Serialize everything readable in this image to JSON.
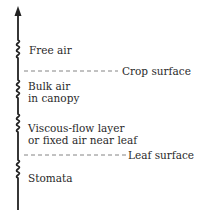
{
  "diagram": {
    "arrow_direction": "up",
    "layers": [
      {
        "label_lines": [
          "Free air"
        ]
      },
      {
        "label_lines": [
          "Bulk air",
          "in canopy"
        ]
      },
      {
        "label_lines": [
          "Viscous-flow layer",
          "or fixed air near leaf"
        ]
      },
      {
        "label_lines": [
          "Stomata"
        ]
      }
    ],
    "boundaries": [
      {
        "label": "Crop surface"
      },
      {
        "label": "Leaf surface"
      }
    ]
  }
}
